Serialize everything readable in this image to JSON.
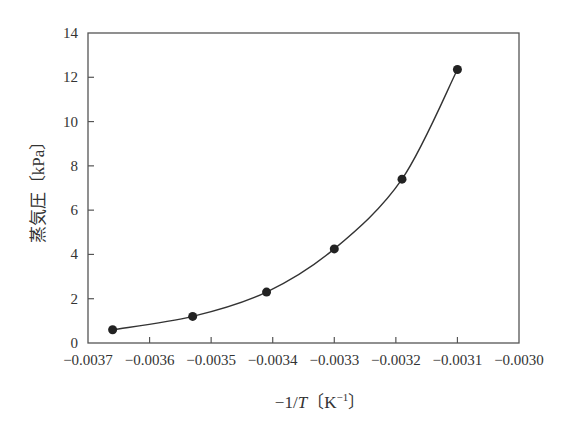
{
  "chart_data": {
    "type": "line",
    "title": "",
    "xlabel": "−1/T〔K⁻¹〕",
    "ylabel": "蒸気圧〔kPa〕",
    "xlim": [
      -0.0037,
      -0.003
    ],
    "ylim": [
      0,
      14
    ],
    "x_ticks": [
      -0.0037,
      -0.0036,
      -0.0035,
      -0.0034,
      -0.0033,
      -0.0032,
      -0.0031,
      -0.003
    ],
    "x_tick_labels": [
      "−0.0037",
      "−0.0036",
      "−0.0035",
      "−0.0034",
      "−0.0033",
      "−0.0032",
      "−0.0031",
      "−0.0030"
    ],
    "y_ticks": [
      0,
      2,
      4,
      6,
      8,
      10,
      12,
      14
    ],
    "y_tick_labels": [
      "0",
      "2",
      "4",
      "6",
      "8",
      "10",
      "12",
      "14"
    ],
    "grid": false,
    "legend": null,
    "series": [
      {
        "name": "蒸気圧",
        "marker": "filled-circle",
        "line": "smooth",
        "color": "#333333",
        "x": [
          -0.00366,
          -0.00353,
          -0.00341,
          -0.0033,
          -0.00319,
          -0.0031
        ],
        "y": [
          0.6,
          1.2,
          2.3,
          4.25,
          7.4,
          12.35
        ]
      }
    ]
  },
  "labels": {
    "y_title": "蒸気圧〔kPa〕",
    "x_title_prefix": "−1/",
    "x_title_var": "T",
    "x_title_unit": "〔K",
    "x_title_sup": "−1",
    "x_title_close": "〕"
  }
}
